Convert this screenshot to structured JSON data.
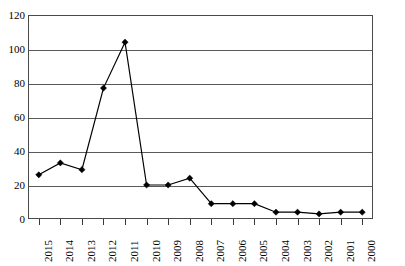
{
  "chart_data": {
    "type": "line",
    "title": "",
    "subtitle": "",
    "xlabel": "",
    "ylabel": "",
    "categories": [
      "2015",
      "2014",
      "2013",
      "2012",
      "2011",
      "2010",
      "2009",
      "2008",
      "2007",
      "2006",
      "2005",
      "2004",
      "2003",
      "2002",
      "2001",
      "2000"
    ],
    "values": [
      26,
      33,
      29,
      77,
      104,
      20,
      20,
      24,
      9,
      9,
      9,
      4,
      4,
      3,
      4,
      4
    ],
    "series": [
      {
        "name": "series-1",
        "values": [
          26,
          33,
          29,
          77,
          104,
          20,
          20,
          24,
          9,
          9,
          9,
          4,
          4,
          3,
          4,
          4
        ]
      }
    ],
    "ylim": [
      0,
      120
    ],
    "yticks": [
      0,
      20,
      40,
      60,
      80,
      100,
      120
    ],
    "ytick_labels": [
      "0",
      "20",
      "40",
      "60",
      "80",
      "100",
      "120"
    ],
    "grid": "horizontal",
    "legend": "none",
    "marker": "diamond",
    "line_color": "#000000",
    "marker_color": "#000000",
    "grid_color": "#5a5a5a",
    "frame_color": "#4a4a4a",
    "background": "#ffffff"
  }
}
